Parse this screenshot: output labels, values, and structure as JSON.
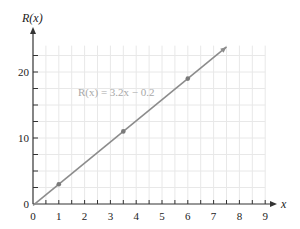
{
  "chart_data": {
    "type": "line",
    "title": "",
    "xlabel": "x",
    "ylabel": "R(x)",
    "x_ticks": [
      "0",
      "1",
      "2",
      "3",
      "4",
      "5",
      "6",
      "7",
      "8",
      "9"
    ],
    "y_ticks": [
      "0",
      "10",
      "20"
    ],
    "xlim": [
      0,
      9
    ],
    "ylim": [
      0,
      24
    ],
    "grid": true,
    "legend": null,
    "annotations": [
      {
        "text": "R(x) = 3.2x − 0.2",
        "x": 3.3,
        "y": 17
      }
    ],
    "series": [
      {
        "name": "R(x) = 3.2x − 0.2",
        "equation": {
          "slope": 3.2,
          "intercept": -0.2
        },
        "x": [
          0,
          7.5
        ],
        "y": [
          -0.2,
          23.8
        ],
        "arrow_end": true,
        "color": "#8c8c8c"
      }
    ],
    "points": [
      {
        "x": 1,
        "y": 3
      },
      {
        "x": 3.5,
        "y": 11
      },
      {
        "x": 6,
        "y": 19
      }
    ]
  },
  "labels": {
    "x_axis": "x",
    "y_axis": "R(x)",
    "equation": "R(x) = 3.2x − 0.2",
    "x_origin": "0",
    "y_origin": "0"
  },
  "colors": {
    "axis": "#333333",
    "grid": "#e8e8e8",
    "line": "#8c8c8c",
    "point": "#7a7a7a",
    "equation_text": "#a8a8a8"
  }
}
